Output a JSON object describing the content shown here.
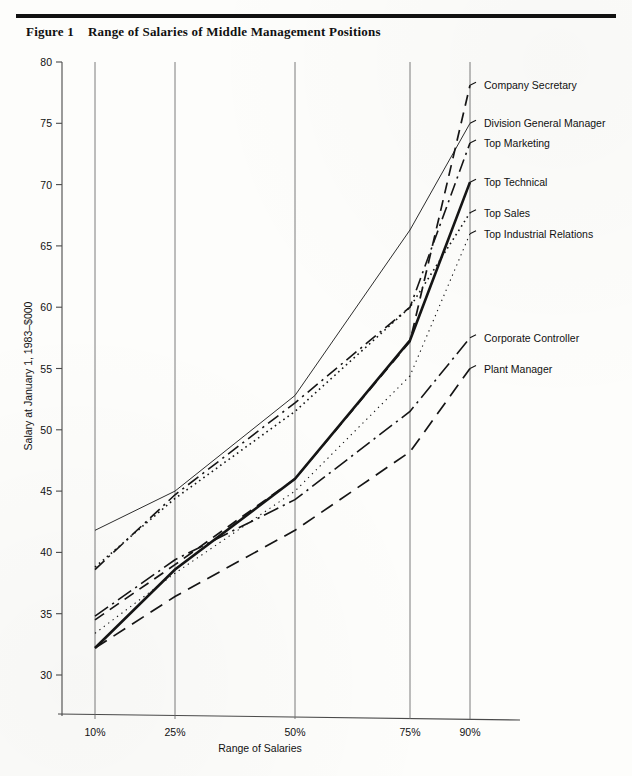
{
  "figure": {
    "number": "Figure 1",
    "title": "Range of Salaries of Middle Management Positions"
  },
  "chart_data": {
    "type": "line",
    "title": "Range of Salaries of Middle Management Positions",
    "xlabel": "Range of Salaries",
    "ylabel": "Salary at January 1, 1983–$000",
    "categories": [
      "10%",
      "25%",
      "50%",
      "75%",
      "90%"
    ],
    "x": [
      10,
      25,
      50,
      75,
      90
    ],
    "ylim": [
      28,
      80
    ],
    "yticks": [
      30,
      35,
      40,
      45,
      50,
      55,
      60,
      65,
      70,
      75,
      80
    ],
    "grid": "vertical-only",
    "legend": "right-of-plot-inline",
    "series": [
      {
        "name": "Company Secretary",
        "style": "dashed",
        "width": "medium",
        "values": [
          34.5,
          39.0,
          46.0,
          57.2,
          78.1
        ],
        "label_y": 78.1
      },
      {
        "name": "Division General Manager",
        "style": "solid-thin",
        "width": "thin",
        "values": [
          41.8,
          45.0,
          52.8,
          66.3,
          75.0
        ],
        "label_y": 75.0
      },
      {
        "name": "Top Marketing",
        "style": "dash-dot",
        "width": "medium",
        "values": [
          38.6,
          44.7,
          52.2,
          60.0,
          73.4
        ],
        "label_y": 73.4
      },
      {
        "name": "Top Technical",
        "style": "solid-thick",
        "width": "thick",
        "values": [
          32.2,
          38.6,
          46.0,
          57.3,
          70.2
        ],
        "label_y": 70.2
      },
      {
        "name": "Top Sales",
        "style": "dotted",
        "width": "medium",
        "values": [
          38.8,
          44.4,
          51.5,
          60.0,
          67.7
        ],
        "label_y": 67.7
      },
      {
        "name": "Top Industrial Relations",
        "style": "dotted-fine",
        "width": "thin",
        "values": [
          33.4,
          38.3,
          45.0,
          54.4,
          66.0
        ],
        "label_y": 66.0
      },
      {
        "name": "Corporate Controller",
        "style": "dash-dot-long",
        "width": "medium",
        "values": [
          34.8,
          39.4,
          44.3,
          51.5,
          57.5
        ],
        "label_y": 57.5
      },
      {
        "name": "Plant Manager",
        "style": "dashed-long",
        "width": "medium",
        "values": [
          32.2,
          36.4,
          41.8,
          48.2,
          55.0
        ],
        "label_y": 55.0
      }
    ]
  }
}
